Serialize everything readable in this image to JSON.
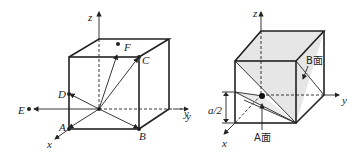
{
  "figure_left": {
    "axes": {
      "x": "x",
      "y": "y",
      "z": "z"
    },
    "points": [
      {
        "label": "A"
      },
      {
        "label": "B"
      },
      {
        "label": "C"
      },
      {
        "label": "D"
      },
      {
        "label": "E"
      },
      {
        "label": "F"
      }
    ]
  },
  "figure_right": {
    "axes": {
      "x": "x",
      "y": "y",
      "z": "z"
    },
    "left_y_axis_label": "y",
    "dimension_label": "a/2",
    "plane_a_label": "A面",
    "plane_b_label": "B面"
  },
  "colors": {
    "line": "#222222",
    "shade": "#e6e6e6"
  }
}
